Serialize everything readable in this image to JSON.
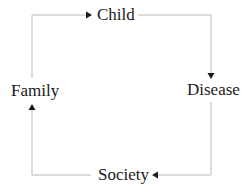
{
  "diagram": {
    "type": "cycle",
    "nodes": [
      {
        "id": "child",
        "label": "Child"
      },
      {
        "id": "disease",
        "label": "Disease"
      },
      {
        "id": "society",
        "label": "Society"
      },
      {
        "id": "family",
        "label": "Family"
      }
    ],
    "edges": [
      {
        "from": "family",
        "to": "child"
      },
      {
        "from": "child",
        "to": "disease"
      },
      {
        "from": "disease",
        "to": "society"
      },
      {
        "from": "society",
        "to": "family"
      }
    ],
    "colors": {
      "line": "#b8b8b8",
      "arrowhead": "#1a1a1a",
      "text": "#1a1a1a",
      "background": "#ffffff"
    }
  }
}
